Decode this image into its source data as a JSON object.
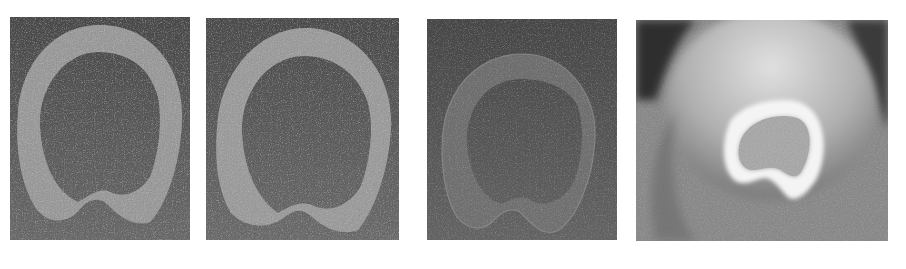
{
  "figure": {
    "panel_count": 4,
    "background_color": "#ffffff",
    "panels": [
      {
        "id": "a",
        "label": "",
        "description": "noisy grey annular cross-section with notched bottom",
        "background_color": "#5a5a5a",
        "ring_color": "#9a9a9a",
        "interior_color": "#4e4e4e",
        "box": {
          "x": 10,
          "y": 17,
          "w": 180,
          "h": 223
        }
      },
      {
        "id": "b",
        "label": "",
        "description": "noisy grey annular cross-section, smoother notch",
        "background_color": "#5c5c5c",
        "ring_color": "#9c9c9c",
        "interior_color": "#505050",
        "box": {
          "x": 206,
          "y": 18,
          "w": 193,
          "h": 222
        }
      },
      {
        "id": "c",
        "label": "",
        "description": "faint translucent outlined ring cross-section",
        "background_color": "#575757",
        "ring_color": "#7a7a7a",
        "interior_color": "#555555",
        "box": {
          "x": 427,
          "y": 19,
          "w": 190,
          "h": 221
        }
      },
      {
        "id": "d",
        "label": "",
        "description": "radiograph with bright white ring over soft tissue",
        "background_color": "#8a8a8a",
        "ring_color": "#f4f4f4",
        "interior_color": "#a8a8a8",
        "box": {
          "x": 636,
          "y": 20,
          "w": 252,
          "h": 221
        }
      }
    ],
    "top_text": {
      "visible": true,
      "legible": false,
      "note": "faint washed-out text fragments above panels; unreadable at 3x zoom, possibly bleed-through from reverse of a scanned page"
    },
    "bottom_text": {
      "visible": true,
      "legible": false,
      "note": "faint washed-out text fragments below panels; unreadable at 3x zoom, possibly bleed-through from reverse of a scanned page"
    }
  }
}
